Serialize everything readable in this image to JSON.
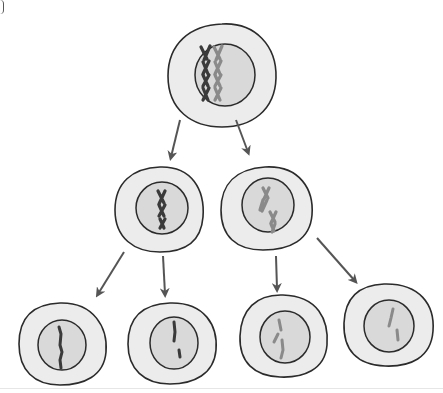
{
  "diagram": {
    "title": "",
    "type": "cell division (meiosis) schematic",
    "colors": {
      "background": "#ffffff",
      "cytoplasm": "#ececec",
      "nucleus": "#d9d9d9",
      "outline": "#2b2b2b",
      "arrow": "#555555",
      "chromosome_dark": "#3a3a3a",
      "chromosome_light": "#8a8a8a"
    },
    "levels": [
      {
        "name": "parent-cell",
        "cells": 1,
        "chromosome_state": "two homologous pairs of replicated chromosomes (dark and light)"
      },
      {
        "name": "meiosis-I-daughters",
        "cells": 2,
        "chromosome_state": "one replicated chromosome per pair (dark / light)"
      },
      {
        "name": "meiosis-II-gametes",
        "cells": 4,
        "chromosome_state": "single chromatids"
      }
    ],
    "arrows": 6
  }
}
